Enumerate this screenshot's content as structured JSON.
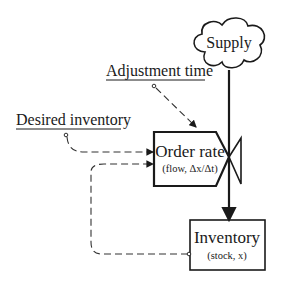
{
  "diagram": {
    "type": "stock-and-flow",
    "nodes": {
      "supply": {
        "label": "Supply",
        "shape": "cloud"
      },
      "order_rate": {
        "label": "Order rate",
        "sublabel": "(flow, Δx/Δt)",
        "shape": "valve-box"
      },
      "inventory": {
        "label": "Inventory",
        "sublabel": "(stock, x)",
        "shape": "rectangle"
      },
      "adjustment_time": {
        "label": "Adjustment time",
        "shape": "parameter"
      },
      "desired_inventory": {
        "label": "Desired inventory",
        "shape": "parameter"
      }
    },
    "edges": [
      {
        "from": "supply",
        "to": "inventory",
        "style": "solid",
        "via": "order_rate valve"
      },
      {
        "from": "adjustment_time",
        "to": "order_rate",
        "style": "dashed"
      },
      {
        "from": "desired_inventory",
        "to": "order_rate",
        "style": "dashed"
      },
      {
        "from": "inventory",
        "to": "order_rate",
        "style": "dashed"
      }
    ]
  }
}
